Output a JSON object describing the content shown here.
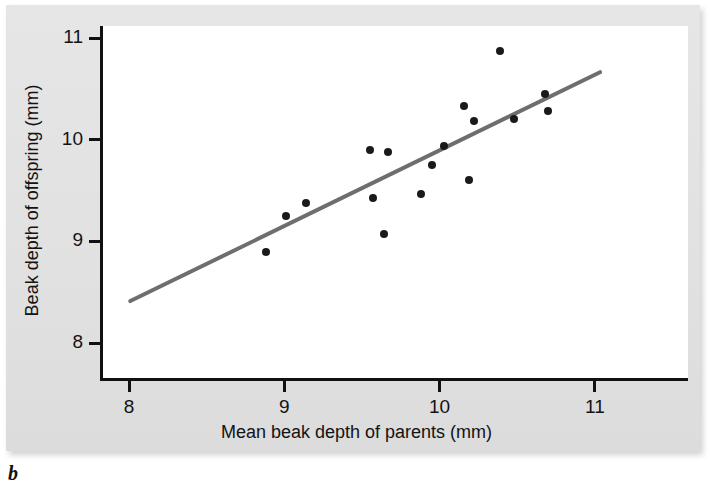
{
  "figure": {
    "panel_letter": "b",
    "background_color": "#e3e3e3",
    "plot_background_color": "#ffffff",
    "axis_color": "#111111",
    "point_color": "#1a1a1a",
    "line_color": "#6e6e6e"
  },
  "chart_data": {
    "type": "scatter",
    "title": "",
    "xlabel": "Mean beak depth of parents (mm)",
    "ylabel": "Beak depth of offspring (mm)",
    "xlim": [
      7.81,
      11.6
    ],
    "ylim": [
      7.62,
      11.12
    ],
    "xticks": [
      8,
      9,
      10,
      11
    ],
    "xticklabels": [
      "8",
      "9",
      "10",
      "11"
    ],
    "yticks": [
      8,
      9,
      10,
      11
    ],
    "yticklabels": [
      "8",
      "9",
      "10",
      "11"
    ],
    "grid": false,
    "legend": null,
    "points": [
      {
        "x": 8.86,
        "y": 8.9
      },
      {
        "x": 8.99,
        "y": 9.25
      },
      {
        "x": 9.12,
        "y": 9.38
      },
      {
        "x": 9.53,
        "y": 9.9
      },
      {
        "x": 9.65,
        "y": 9.88
      },
      {
        "x": 9.55,
        "y": 9.43
      },
      {
        "x": 9.62,
        "y": 9.07
      },
      {
        "x": 9.86,
        "y": 9.47
      },
      {
        "x": 9.93,
        "y": 9.75
      },
      {
        "x": 10.01,
        "y": 9.94
      },
      {
        "x": 10.14,
        "y": 10.33
      },
      {
        "x": 10.2,
        "y": 10.18
      },
      {
        "x": 10.17,
        "y": 9.6
      },
      {
        "x": 10.37,
        "y": 10.87
      },
      {
        "x": 10.46,
        "y": 10.2
      },
      {
        "x": 10.66,
        "y": 10.45
      },
      {
        "x": 10.68,
        "y": 10.28
      }
    ],
    "trendline": {
      "label": "regression line",
      "x_start": 7.99,
      "y_start": 8.39,
      "x_end": 11.03,
      "y_end": 10.66
    }
  }
}
